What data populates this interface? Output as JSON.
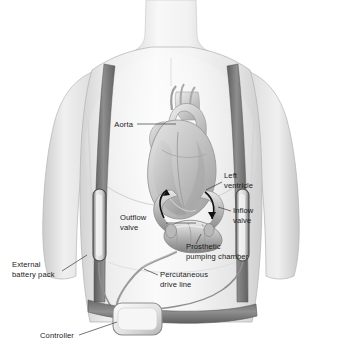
{
  "figure": {
    "background_color": "#ffffff"
  },
  "palette": {
    "background": "#ffffff",
    "skin_light": "#f2f2f2",
    "skin_mid": "#e0e0e0",
    "skin_shadow": "#c9c9c9",
    "outline": "#9a9a9a",
    "strap_dark": "#6e6e6e",
    "strap_mid": "#8a8a8a",
    "heart_light": "#dcdcdc",
    "heart_mid": "#bdbdbd",
    "heart_dark": "#8e8e8e",
    "device_light": "#d6d6d6",
    "device_mid": "#a8a8a8",
    "device_dark": "#7a7a7a",
    "arrow": "#111111",
    "label_text": "#1a1a1a",
    "leader_line": "#3a3a3a"
  },
  "labels": [
    {
      "id": "aorta",
      "name": "aorta",
      "lines": [
        "Aorta"
      ],
      "x": 133,
      "y": 127,
      "anchor": "end",
      "leader": "M137,124 L176,124"
    },
    {
      "id": "left-ventricle",
      "name": "left-ventricle",
      "lines": [
        "Left",
        "ventricle"
      ],
      "x": 224,
      "y": 178,
      "anchor": "start",
      "leader": "M222,182 L206,190"
    },
    {
      "id": "inflow-valve",
      "name": "inflow-valve",
      "lines": [
        "Inflow",
        "valve"
      ],
      "x": 233,
      "y": 213,
      "anchor": "start",
      "leader": "M231,211 L218,207"
    },
    {
      "id": "outflow-valve",
      "name": "outflow-valve",
      "lines": [
        "Outflow",
        "valve"
      ],
      "x": 120,
      "y": 220,
      "anchor": "start",
      "leader": "M166,223 L196,223"
    },
    {
      "id": "prosthetic-pumping-chamber",
      "name": "prosthetic-pumping-chamber",
      "lines": [
        "Prosthetic",
        "pumping chamber"
      ],
      "x": 186,
      "y": 249,
      "anchor": "start",
      "leader": "M196,244 L201,234"
    },
    {
      "id": "percutaneous-drive-line",
      "name": "percutaneous-drive-line",
      "lines": [
        "Percutaneous",
        "drive line"
      ],
      "x": 160,
      "y": 277,
      "anchor": "start",
      "leader": "M158,275 L144,269"
    },
    {
      "id": "external-battery-pack",
      "name": "external-battery-pack",
      "lines": [
        "External",
        "battery pack"
      ],
      "x": 12,
      "y": 267,
      "anchor": "start",
      "leader": "M62,271 L87,255"
    },
    {
      "id": "controller",
      "name": "controller",
      "lines": [
        "Controller"
      ],
      "x": 40,
      "y": 338,
      "anchor": "start",
      "leader": "M79,335 L117,322"
    }
  ],
  "components": {
    "shoulder_straps": "dark gray harness straps over both shoulders",
    "waist_belt": "dark gray belt across lower abdomen",
    "battery_left": "vertical capsule on left strap",
    "battery_right": "vertical capsule on right strap",
    "controller_box": "rounded rectangle box attached to waist belt",
    "drive_line": "thin tube from pump chamber through skin to controller",
    "pump_chamber": "lobed prosthetic pumping chamber below heart",
    "inflow_cannula": "tube from left ventricle apex to pump",
    "outflow_cannula": "tube from pump to aorta",
    "flow_arrows": [
      "inflow-arrow",
      "outflow-arrow"
    ]
  }
}
